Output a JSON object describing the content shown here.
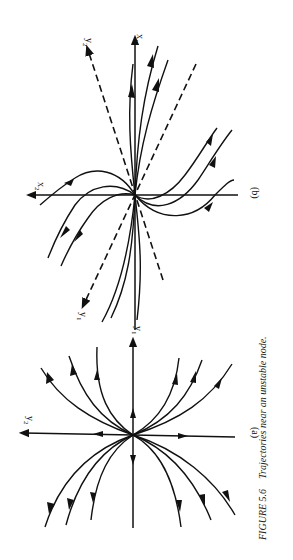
{
  "figure": {
    "number_label": "FIGURE 5.6",
    "caption": "Trajectories near an unstable node.",
    "panel_a": {
      "label": "(a)",
      "axes": {
        "vertical": "y",
        "vertical_sub": "1",
        "horizontal": "y",
        "horizontal_sub": "2"
      }
    },
    "panel_b": {
      "label": "(b)",
      "axes": {
        "vertical": "x",
        "vertical_sub": "1",
        "horizontal": "x",
        "horizontal_sub": "2",
        "dashed_upper": "y",
        "dashed_upper_sub": "2",
        "dashed_lower": "y",
        "dashed_lower_sub": "1"
      }
    }
  },
  "colors": {
    "ink": "#111111",
    "background": "#ffffff"
  }
}
